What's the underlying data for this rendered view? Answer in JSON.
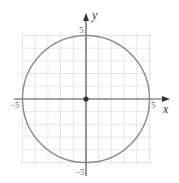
{
  "chart_data": {
    "type": "line",
    "title": "",
    "xlabel": "x",
    "ylabel": "y",
    "xlim": [
      -5,
      5
    ],
    "ylim": [
      -5,
      5
    ],
    "grid": true,
    "grid_step": 1,
    "series": [
      {
        "name": "circle",
        "equation": "x^2 + y^2 = 25",
        "center": [
          0,
          0
        ],
        "radius": 5,
        "color": "#8a8a8a"
      }
    ],
    "points": [
      {
        "label": "center",
        "x": 0,
        "y": 0
      }
    ],
    "tick_labels": {
      "x": [
        "-5",
        "5"
      ],
      "y": [
        "5",
        "-5"
      ]
    }
  },
  "labels": {
    "x_axis": "x",
    "y_axis": "y",
    "x_neg": "−5",
    "x_pos": "5",
    "y_pos": "5",
    "y_neg": "−5"
  },
  "colors": {
    "axis": "#555555",
    "circle": "#8a8a8a",
    "grid": "#e6e6e6",
    "point": "#333333"
  }
}
